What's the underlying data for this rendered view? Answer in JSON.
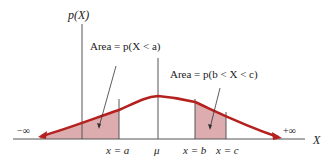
{
  "diagram": {
    "y_axis_label": "p(X)",
    "x_axis_label": "X",
    "neg_inf_label": "−∞",
    "pos_inf_label": "+∞",
    "tick_labels": {
      "a": "x = a",
      "mu": "μ",
      "b": "x = b",
      "c": "x = c"
    },
    "annotations": {
      "left_area": "Area = p(X < a)",
      "middle_area": "Area = p(b < X < c)"
    },
    "colors": {
      "curve": "#b5211f",
      "shaded_area": "#d9a3a6",
      "axis": "#555555",
      "text": "#222222"
    }
  }
}
